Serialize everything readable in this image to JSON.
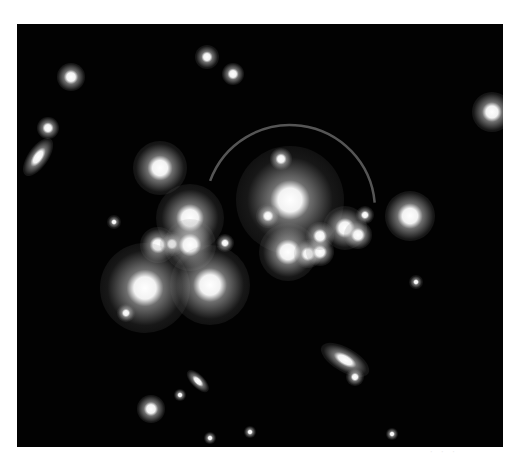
{
  "image": {
    "description": "Black-and-white deep-field photograph of a galaxy cluster with a gravitational lensing arc",
    "background_color": "#020202",
    "page_color": "#ffffff",
    "frame": {
      "x": 17,
      "y": 24,
      "width": 486,
      "height": 423
    },
    "lensing_arc": {
      "cx": 290,
      "cy": 210,
      "r": 85,
      "start_deg": 200,
      "end_deg": 355,
      "color": "#6a6a6a"
    },
    "sources": [
      {
        "name": "central-bright-galaxy",
        "x": 290,
        "y": 200,
        "r": 14,
        "halo": 40
      },
      {
        "name": "galaxy-left-upper",
        "x": 160,
        "y": 168,
        "r": 9,
        "halo": 18
      },
      {
        "name": "galaxy-left-mid",
        "x": 190,
        "y": 218,
        "r": 10,
        "halo": 24
      },
      {
        "name": "galaxy-left-pair-a",
        "x": 158,
        "y": 245,
        "r": 6,
        "halo": 12
      },
      {
        "name": "galaxy-left-pair-b",
        "x": 172,
        "y": 244,
        "r": 4,
        "halo": 8
      },
      {
        "name": "galaxy-left-center",
        "x": 190,
        "y": 245,
        "r": 8,
        "halo": 18
      },
      {
        "name": "galaxy-lower-left-large",
        "x": 145,
        "y": 288,
        "r": 13,
        "halo": 32
      },
      {
        "name": "galaxy-lower-center-large",
        "x": 210,
        "y": 285,
        "r": 12,
        "halo": 28
      },
      {
        "name": "galaxy-right-cluster-a",
        "x": 288,
        "y": 252,
        "r": 9,
        "halo": 20
      },
      {
        "name": "galaxy-right-cluster-b",
        "x": 308,
        "y": 254,
        "r": 5,
        "halo": 9
      },
      {
        "name": "galaxy-right-cluster-c",
        "x": 320,
        "y": 252,
        "r": 5,
        "halo": 9
      },
      {
        "name": "galaxy-right-cluster-d",
        "x": 320,
        "y": 236,
        "r": 5,
        "halo": 9
      },
      {
        "name": "galaxy-arc-end-a",
        "x": 345,
        "y": 228,
        "r": 7,
        "halo": 15
      },
      {
        "name": "galaxy-arc-end-b",
        "x": 358,
        "y": 235,
        "r": 5,
        "halo": 9
      },
      {
        "name": "galaxy-arc-end-c",
        "x": 365,
        "y": 215,
        "r": 3,
        "halo": 6
      },
      {
        "name": "galaxy-small-center",
        "x": 268,
        "y": 216,
        "r": 4,
        "halo": 8
      },
      {
        "name": "galaxy-small-above",
        "x": 281,
        "y": 159,
        "r": 4,
        "halo": 7
      },
      {
        "name": "galaxy-right-isolated",
        "x": 410,
        "y": 216,
        "r": 9,
        "halo": 16
      },
      {
        "name": "star-top-left",
        "x": 71,
        "y": 77,
        "r": 5,
        "halo": 9
      },
      {
        "name": "star-top-center",
        "x": 207,
        "y": 57,
        "r": 4,
        "halo": 8
      },
      {
        "name": "star-top-center-b",
        "x": 233,
        "y": 74,
        "r": 4,
        "halo": 7
      },
      {
        "name": "star-far-right",
        "x": 492,
        "y": 112,
        "r": 7,
        "halo": 13
      },
      {
        "name": "galaxy-left-edge-elongated",
        "x": 38,
        "y": 157,
        "r": 8,
        "halo": 14,
        "elongated": true,
        "rot": -55
      },
      {
        "name": "star-left-edge",
        "x": 48,
        "y": 128,
        "r": 4,
        "halo": 7
      },
      {
        "name": "galaxy-bottom-elongated",
        "x": 345,
        "y": 360,
        "r": 9,
        "halo": 18,
        "elongated": true,
        "rot": 30
      },
      {
        "name": "galaxy-bottom-small",
        "x": 355,
        "y": 377,
        "r": 3,
        "halo": 6
      },
      {
        "name": "galaxy-bottom-left-elongated",
        "x": 198,
        "y": 381,
        "r": 5,
        "halo": 9,
        "elongated": true,
        "rot": 45
      },
      {
        "name": "star-bottom-left",
        "x": 151,
        "y": 409,
        "r": 5,
        "halo": 9
      },
      {
        "name": "star-bottom-a",
        "x": 180,
        "y": 395,
        "r": 2,
        "halo": 4
      },
      {
        "name": "star-small-left",
        "x": 114,
        "y": 222,
        "r": 2,
        "halo": 5
      },
      {
        "name": "star-small-left-b",
        "x": 126,
        "y": 313,
        "r": 3,
        "halo": 6
      },
      {
        "name": "star-small-right",
        "x": 416,
        "y": 282,
        "r": 2,
        "halo": 5
      },
      {
        "name": "star-small-mid",
        "x": 225,
        "y": 243,
        "r": 3,
        "halo": 6
      },
      {
        "name": "star-bottom-b",
        "x": 250,
        "y": 432,
        "r": 2,
        "halo": 4
      },
      {
        "name": "star-bottom-c",
        "x": 210,
        "y": 438,
        "r": 2,
        "halo": 4
      },
      {
        "name": "star-bottom-d",
        "x": 392,
        "y": 434,
        "r": 2,
        "halo": 4
      }
    ],
    "corner_marks": "faint illegible smudges"
  }
}
